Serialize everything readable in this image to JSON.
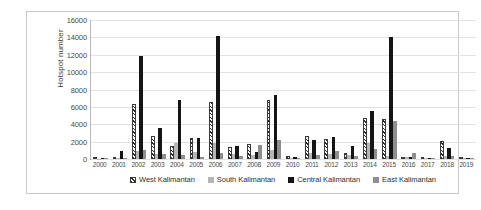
{
  "chart_data": {
    "type": "bar",
    "title": "",
    "xlabel": "",
    "ylabel": "Hotspot number",
    "ylim": [
      0,
      16000
    ],
    "ytick_labels": [
      "16000",
      "14000",
      "12000",
      "10000",
      "8000",
      "6000",
      "4000",
      "2000",
      "0"
    ],
    "ytick_values": [
      16000,
      14000,
      12000,
      10000,
      8000,
      6000,
      4000,
      2000,
      0
    ],
    "grid": true,
    "legend_position": "bottom",
    "categories": [
      "2000",
      "2001",
      "2002",
      "2003",
      "2004",
      "2005",
      "2006",
      "2007",
      "2008",
      "2009",
      "2010",
      "2011",
      "2012",
      "2013",
      "2014",
      "2015",
      "2016",
      "2017",
      "2018",
      "2019"
    ],
    "series": [
      {
        "name": "West Kalimantan",
        "pattern": "hatched",
        "color": "#2b2b2b",
        "values": [
          60,
          150,
          6350,
          2650,
          1550,
          2400,
          6550,
          1350,
          1700,
          6850,
          300,
          2600,
          2250,
          650,
          4700,
          4650,
          200,
          120,
          2100,
          150
        ]
      },
      {
        "name": "South Kalimantan",
        "pattern": "solid",
        "color": "#b6b6b6",
        "values": [
          50,
          120,
          950,
          550,
          1900,
          850,
          1800,
          600,
          500,
          1050,
          120,
          700,
          600,
          450,
          1850,
          300,
          180,
          60,
          350,
          60
        ]
      },
      {
        "name": "Central Kalimantan",
        "pattern": "solid",
        "color": "#151515",
        "values": [
          80,
          950,
          11850,
          3600,
          6750,
          2400,
          14200,
          1450,
          850,
          7350,
          200,
          2200,
          2500,
          1500,
          5550,
          14000,
          250,
          90,
          1300,
          150
        ]
      },
      {
        "name": "East Kalimantan",
        "pattern": "solid",
        "color": "#8e8e8e",
        "values": [
          60,
          100,
          1000,
          600,
          450,
          250,
          700,
          350,
          1650,
          2150,
          100,
          500,
          950,
          400,
          1200,
          4350,
          700,
          120,
          350,
          60
        ]
      }
    ]
  },
  "legend": {
    "items": [
      {
        "label": "West Kalimantan",
        "swatch_class": "s-west"
      },
      {
        "label": "South Kalimantan",
        "swatch_class": "s-south"
      },
      {
        "label": "Central Kalimantan",
        "swatch_class": "s-central"
      },
      {
        "label": "East Kalimantan",
        "swatch_class": "s-east"
      }
    ]
  }
}
